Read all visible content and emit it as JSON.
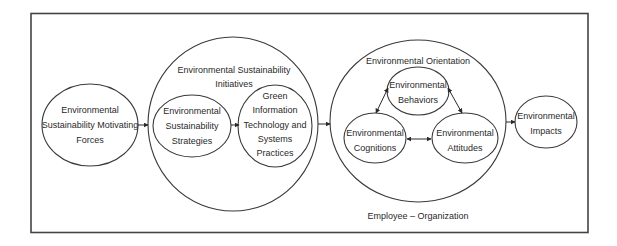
{
  "diagram": {
    "type": "conceptual-model",
    "colors": {
      "stroke": "#3a3a3a",
      "text": "#2a2a2a",
      "background": "#ffffff"
    },
    "nodes": {
      "motivating_forces": {
        "lines": [
          "Environmental",
          "Sustainability Motivating",
          "Forces"
        ]
      },
      "initiatives": {
        "title_lines": [
          "Environmental Sustainability",
          "Initiatives"
        ],
        "children": {
          "strategies": {
            "lines": [
              "Environmental",
              "Sustainability",
              "Strategies"
            ]
          },
          "green_it": {
            "lines": [
              "Green",
              "Information",
              "Technology and",
              "Systems",
              "Practices"
            ]
          }
        }
      },
      "orientation": {
        "title": "Environmental Orientation",
        "children": {
          "behaviors": {
            "lines": [
              "Environmental",
              "Behaviors"
            ]
          },
          "cognitions": {
            "lines": [
              "Environmental",
              "Cognitions"
            ]
          },
          "attitudes": {
            "lines": [
              "Environmental",
              "Attitudes"
            ]
          }
        }
      },
      "impacts": {
        "lines": [
          "Environmental",
          "Impacts"
        ]
      }
    },
    "level_label": "Employee – Organization",
    "edges": [
      {
        "from": "Environmental Sustainability Motivating Forces",
        "to": "Environmental Sustainability Initiatives",
        "kind": "directed"
      },
      {
        "from": "Environmental Sustainability Strategies",
        "to": "Green Information Technology and Systems Practices",
        "kind": "directed"
      },
      {
        "from": "Environmental Sustainability Initiatives",
        "to": "Environmental Orientation",
        "kind": "directed"
      },
      {
        "from": "Environmental Orientation",
        "to": "Environmental Impacts",
        "kind": "directed"
      },
      {
        "from": "Environmental Behaviors",
        "to": "Environmental Cognitions",
        "kind": "bidirectional"
      },
      {
        "from": "Environmental Behaviors",
        "to": "Environmental Attitudes",
        "kind": "bidirectional"
      },
      {
        "from": "Environmental Cognitions",
        "to": "Environmental Attitudes",
        "kind": "bidirectional"
      }
    ]
  }
}
